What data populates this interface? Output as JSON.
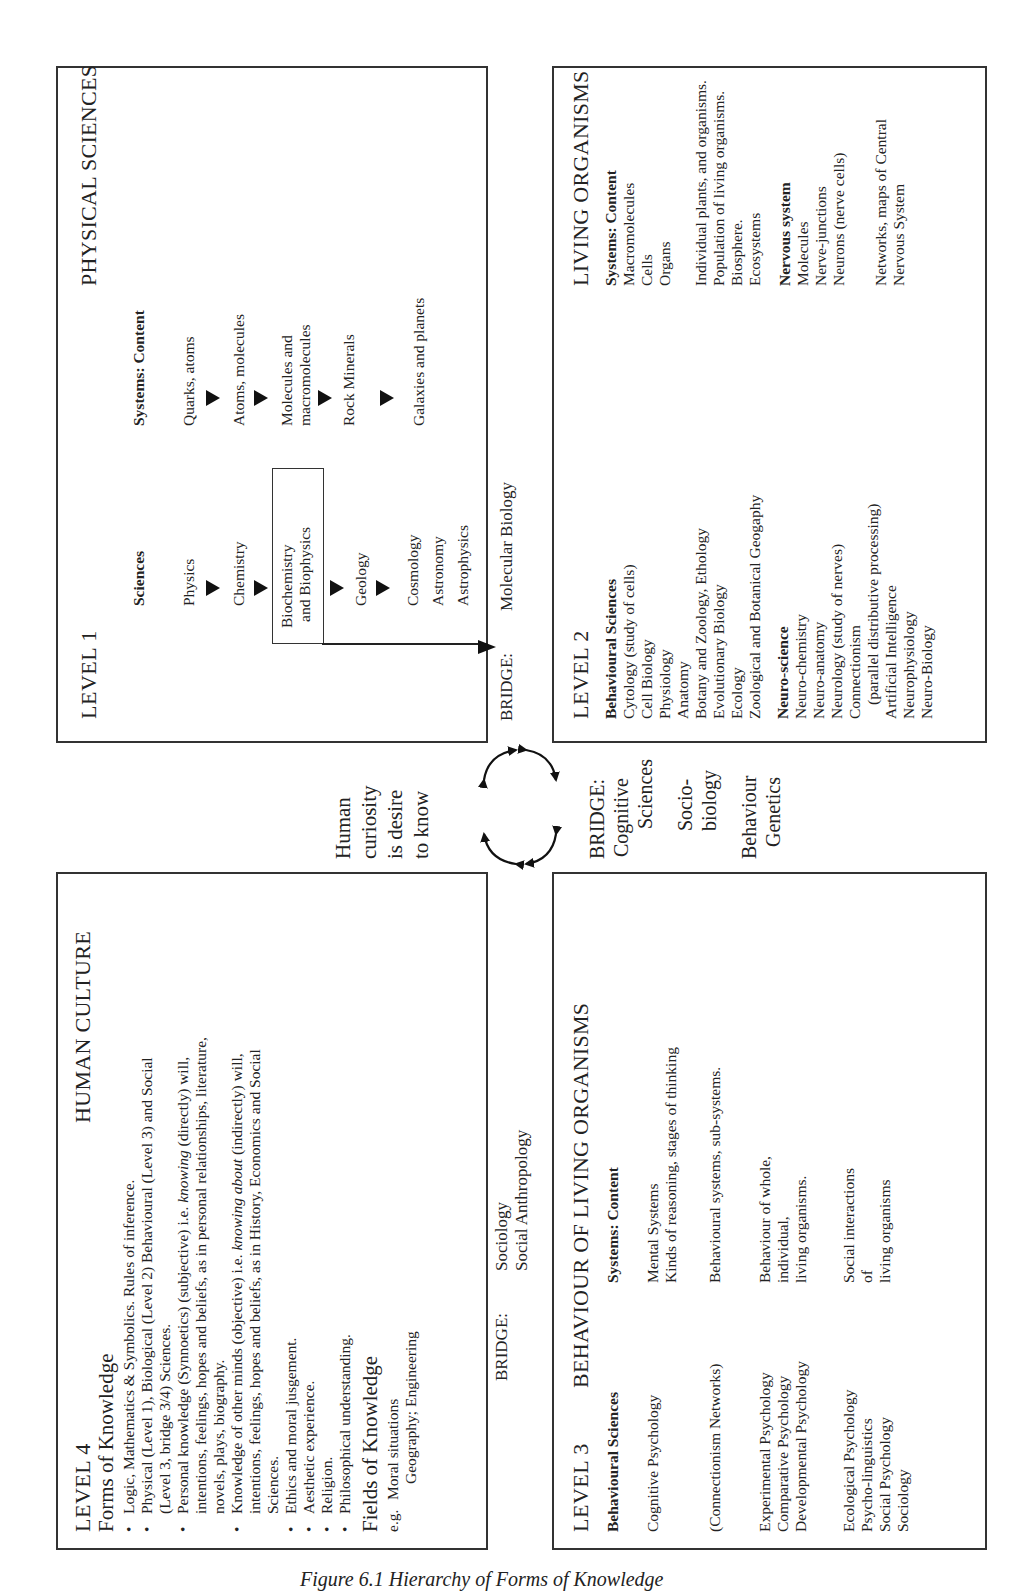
{
  "caption": "Figure 6.1   Hierarchy of Forms of Knowledge",
  "center": {
    "curiosity_lines": [
      "Human",
      "curiosity",
      "is desire",
      "to know"
    ],
    "cycle_arrows": "four bidirectional curved arrows forming a circle"
  },
  "level1": {
    "level": "LEVEL 1",
    "title": "PHYSICAL SCIENCES",
    "sciences_header": "Sciences",
    "systems_header": "Systems: Content",
    "sciences": [
      "Physics",
      "Chemistry",
      "Biochemistry",
      "and Biophysics",
      "Geology",
      "Cosmology",
      "Astronomy",
      "Astrophysics"
    ],
    "systems": [
      "Quarks, atoms",
      "Atoms, molecules",
      "Molecules and",
      "macromolecules",
      "Rock Minerals",
      "Galaxies and planets"
    ]
  },
  "bridge_1_2": {
    "label": "BRIDGE:",
    "value": "Molecular Biology"
  },
  "level2": {
    "level": "LEVEL 2",
    "title": "LIVING ORGANISMS",
    "behavioural_header": "Behavioural Sciences",
    "behavioural": [
      "Cytology (study of cells)",
      "Cell Biology",
      "Physiology",
      "Anatomy",
      "Botany and Zoology, Ethology",
      "Evolutionary Biology",
      "Ecology",
      "Zoological and Botanical Geogaphy"
    ],
    "neuro_header": "Neuro-science",
    "neuro": [
      "Neuro-chemistry",
      "Neuro-anatomy",
      "Neurology (study of nerves)",
      "Connectionism",
      "(parallel distributive processing)",
      "Artificial Intelligence",
      "Neurophysiology",
      "Neuro-Biology"
    ],
    "systems_header": "Systems: Content",
    "systems_a": [
      "Macromolecules",
      "Cells",
      "Organs"
    ],
    "systems_b": [
      "Individual plants, and organisms.",
      "Population of living organisms.",
      "Biosphere.",
      "Ecosystems"
    ],
    "nervous_header": "Nervous system",
    "nervous": [
      "Molecules",
      "Nerve-junctions",
      "Neurons (nerve cells)"
    ],
    "networks": [
      "Networks, maps of Central",
      "Nervous System"
    ]
  },
  "bridge_2_3": {
    "label": "BRIDGE:",
    "lines": [
      "Cognitive",
      "Sciences"
    ],
    "socio": [
      "Socio-",
      "biology"
    ],
    "genetics": [
      "Behaviour",
      "Genetics"
    ]
  },
  "level3": {
    "level": "LEVEL 3",
    "title": "BEHAVIOUR OF LIVING ORGANISMS",
    "sciences_header": "Behavioural Sciences",
    "systems_header": "Systems: Content",
    "rows": [
      {
        "sciences": [
          "Cognitive Psychology"
        ],
        "content": [
          "Mental Systems",
          "Kinds of reasoning, stages of thinking"
        ]
      },
      {
        "sciences": [
          "(Connectionism Networks)"
        ],
        "content": [
          "Behavioural systems, sub-systems."
        ]
      },
      {
        "sciences": [
          "Experimental Psychology",
          "Comparative Psychology",
          "Developmental Psychology"
        ],
        "content": [
          "Behaviour of whole,",
          "individual,",
          "living organisms."
        ]
      },
      {
        "sciences": [
          "Ecological Psychology",
          "Psycho-linguistics",
          "Social Psychology",
          "Sociology"
        ],
        "content": [
          "Social interactions",
          "of",
          "living organisms"
        ]
      }
    ]
  },
  "bridge_3_4": {
    "label": "BRIDGE:",
    "lines": [
      "Sociology",
      "Social Anthropology"
    ]
  },
  "level4": {
    "level": "LEVEL 4",
    "title": "HUMAN CULTURE",
    "forms_header": "Forms of Knowledge",
    "forms": [
      {
        "bullet": true,
        "lines": [
          "Logic, Mathematics & Symbolics. Rules of inference."
        ]
      },
      {
        "bullet": true,
        "lines": [
          "Physical (Level 1), Biological (Level 2) Behavioural (Level 3) and Social",
          "(Level 3, bridge 3/4) Sciences."
        ]
      },
      {
        "bullet": true,
        "pre": "Personal knowledge (Synnoetics) (subjective) i.e. ",
        "em": "knowing",
        "post": " (directly) will,",
        "lines": [
          "intentions, feelings, hopes and beliefs, as in personal relationships, literature,",
          "novels, plays, biography."
        ]
      },
      {
        "bullet": true,
        "pre": "Knowledge of other minds (objective) i.e. ",
        "em": "knowing about",
        "post": " (indirectly) will,",
        "lines": [
          "intentions, feelings, hopes and beliefs, as in History, Economics and Social",
          "Sciences."
        ]
      },
      {
        "bullet": true,
        "lines": [
          "Ethics and moral jusgement."
        ]
      },
      {
        "bullet": true,
        "lines": [
          "Aesthetic experience."
        ]
      },
      {
        "bullet": true,
        "lines": [
          "Religion."
        ]
      },
      {
        "bullet": true,
        "lines": [
          "Philosophical understanding."
        ]
      }
    ],
    "fields_header": "Fields of Knowledge",
    "fields_eg": "e.g.",
    "fields": [
      "Moral situations",
      "Geography; Engineering"
    ]
  }
}
